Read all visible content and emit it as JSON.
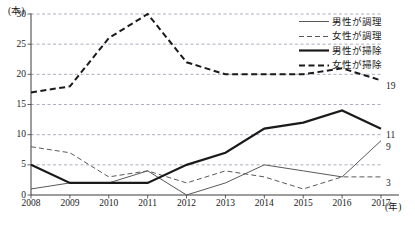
{
  "chart_data": {
    "type": "line",
    "title": "",
    "xlabel": "(年)",
    "ylabel": "(本)",
    "x": [
      2008,
      2009,
      2010,
      2011,
      2012,
      2013,
      2014,
      2015,
      2016,
      2017
    ],
    "xticklabels": [
      "2008",
      "2009",
      "2010",
      "2011",
      "2012",
      "2013",
      "2014",
      "2015",
      "2016",
      "2017"
    ],
    "yticklabels": [
      "0",
      "5",
      "10",
      "15",
      "20",
      "25",
      "30"
    ],
    "yticks": [
      0,
      5,
      10,
      15,
      20,
      25,
      30
    ],
    "ylim": [
      0,
      30
    ],
    "grid": "horizontal-dashed",
    "legend_position": "top-right",
    "series": [
      {
        "name": "男性が調理",
        "style": "solid-thin",
        "color": "#595959",
        "values": [
          1,
          2,
          2,
          4,
          0,
          2,
          5,
          4,
          3,
          9
        ],
        "end_label": "9"
      },
      {
        "name": "女性が調理",
        "style": "dashed-thin",
        "color": "#595959",
        "values": [
          8,
          7,
          3,
          4,
          2,
          4,
          3,
          1,
          3,
          3
        ],
        "end_label": "3"
      },
      {
        "name": "男性が掃除",
        "style": "solid-thick",
        "color": "#1a1a1a",
        "values": [
          5,
          2,
          2,
          2,
          5,
          7,
          11,
          12,
          14,
          11
        ],
        "end_label": "11"
      },
      {
        "name": "女性が掃除",
        "style": "dashed-thick",
        "color": "#1a1a1a",
        "values": [
          17,
          18,
          26,
          30,
          22,
          20,
          20,
          20,
          21,
          19
        ],
        "end_label": "19"
      }
    ]
  }
}
